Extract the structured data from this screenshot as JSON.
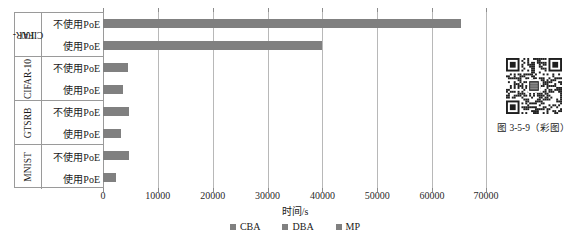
{
  "figure": {
    "caption": "图 3-5-9（彩图）",
    "qr_icon": "qr-code-icon"
  },
  "chart_data": {
    "type": "bar",
    "orientation": "horizontal",
    "title": "",
    "xlabel": "时间/s",
    "ylabel": "",
    "xlim": [
      0,
      70000
    ],
    "xticks": [
      "0",
      "10000",
      "20000",
      "30000",
      "40000",
      "50000",
      "60000",
      "70000"
    ],
    "xtick_values": [
      0,
      10000,
      20000,
      30000,
      40000,
      50000,
      60000,
      70000
    ],
    "grid": true,
    "legend_position": "bottom",
    "legend": [
      "CBA",
      "DBA",
      "MP"
    ],
    "series": [
      {
        "name": "CBA",
        "values": [
          65500,
          40000,
          4600,
          3700,
          4700,
          3300,
          4800,
          2400
        ]
      }
    ],
    "groups": [
      {
        "name": "CIFAR-100",
        "name_lines": [
          "CIFAR-",
          "100"
        ],
        "rows": [
          {
            "label": "不使用PoE",
            "value": 65500
          },
          {
            "label": "使用PoE",
            "value": 40000
          }
        ]
      },
      {
        "name": "CIFAR-10",
        "name_lines": [
          "CIFAR-10"
        ],
        "rows": [
          {
            "label": "不使用PoE",
            "value": 4600
          },
          {
            "label": "使用PoE",
            "value": 3700
          }
        ]
      },
      {
        "name": "GTSRB",
        "name_lines": [
          "GTSRB"
        ],
        "rows": [
          {
            "label": "不使用PoE",
            "value": 4700
          },
          {
            "label": "使用PoE",
            "value": 3300
          }
        ]
      },
      {
        "name": "MNIST",
        "name_lines": [
          "MNIST"
        ],
        "rows": [
          {
            "label": "不使用PoE",
            "value": 4800
          },
          {
            "label": "使用PoE",
            "value": 2400
          }
        ]
      }
    ],
    "colors": {
      "bar": "#808080",
      "gridline": "#b8b8b8",
      "axis": "#9a9a9a",
      "text": "#1a1a1a"
    }
  },
  "groups": {
    "g0": {
      "name0": "CIFAR-",
      "name1": "100",
      "r0": "不使用PoE",
      "r1": "使用PoE"
    },
    "g1": {
      "name0": "CIFAR-10",
      "r0": "不使用PoE",
      "r1": "使用PoE"
    },
    "g2": {
      "name0": "GTSRB",
      "r0": "不使用PoE",
      "r1": "使用PoE"
    },
    "g3": {
      "name0": "MNIST",
      "r0": "不使用PoE",
      "r1": "使用PoE"
    }
  },
  "axis": {
    "t0": "0",
    "t1": "10000",
    "t2": "20000",
    "t3": "30000",
    "t4": "40000",
    "t5": "50000",
    "t6": "60000",
    "t7": "70000",
    "title": "时间/s"
  },
  "legend": {
    "i0": "CBA",
    "i1": "DBA",
    "i2": "MP"
  }
}
